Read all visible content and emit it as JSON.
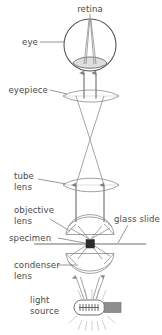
{
  "diagram": {
    "labels": {
      "retina": "retina",
      "eye": "eye",
      "eyepiece": "eyepiece",
      "tube_lens_line1": "tube",
      "tube_lens_line2": "lens",
      "objective_lens_line1": "objective",
      "objective_lens_line2": "lens",
      "glass_slide": "glass slide",
      "specimen": "specimen",
      "condenser_lens_line1": "condenser",
      "condenser_lens_line2": "lens",
      "light_source_line1": "light",
      "light_source_line2": "source"
    },
    "colors": {
      "text": "#4a4a4a",
      "ray": "#8d8d8d",
      "lens_outline": "#8a8a8a",
      "eye_outline": "#555555",
      "cornea_fill": "#d8d8d8",
      "slide": "#b6b6b6",
      "specimen": "#2b2b2b",
      "bulb_base": "#8e8e8e",
      "background": "#ffffff"
    },
    "components": [
      "retina",
      "eye",
      "eyepiece",
      "tube lens",
      "objective lens",
      "glass slide",
      "specimen",
      "condenser lens",
      "light source"
    ]
  }
}
